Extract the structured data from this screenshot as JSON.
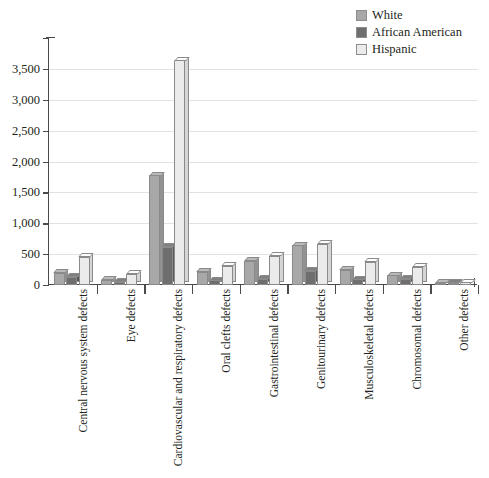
{
  "chart_data": {
    "type": "bar",
    "title": "",
    "subtitle": "",
    "xlabel": "",
    "ylabel": "",
    "ylim": [
      0,
      4000
    ],
    "yticks": [
      "0",
      "500",
      "1,000",
      "1,500",
      "2,000",
      "2,500",
      "3,000",
      "3,500"
    ],
    "ytick_values": [
      0,
      500,
      1000,
      1500,
      2000,
      2500,
      3000,
      3500
    ],
    "grid": true,
    "legend_position": "top-right",
    "categories": [
      "Central nervous system defects",
      "Eye defects",
      "Cardiovascular and respiratory defects",
      "Oral clefts defects",
      "Gastrointestinal defects",
      "Genitourinary defects",
      "Musculoskeletal defects",
      "Chromosomal defects",
      "Other defects"
    ],
    "series": [
      {
        "name": "White",
        "color": "#a8a8a8",
        "values": [
          200,
          85,
          1780,
          215,
          390,
          640,
          250,
          155,
          40
        ]
      },
      {
        "name": "African American",
        "color": "#6e6e6e",
        "values": [
          135,
          55,
          620,
          75,
          100,
          230,
          95,
          100,
          35
        ]
      },
      {
        "name": "Hispanic",
        "color": "#ebebeb",
        "values": [
          455,
          180,
          3640,
          310,
          475,
          670,
          375,
          295,
          45
        ]
      }
    ]
  },
  "legend": {
    "items": [
      {
        "label": "White",
        "color": "#a8a8a8"
      },
      {
        "label": "African American",
        "color": "#6e6e6e"
      },
      {
        "label": "Hispanic",
        "color": "#ebebeb"
      }
    ]
  },
  "colors": {
    "axis": "#4a4a4a",
    "grid": "#e2e2e2",
    "text": "#231f20",
    "background": "#ffffff",
    "bar_outline": "#8a8a8a"
  }
}
